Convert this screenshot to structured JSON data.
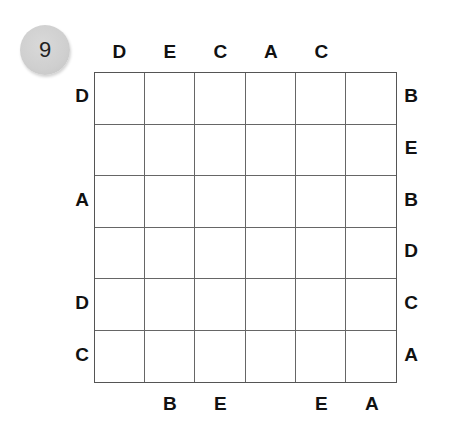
{
  "puzzle": {
    "number": "9",
    "rows": 6,
    "cols": 6,
    "clues": {
      "top": [
        "D",
        "E",
        "C",
        "A",
        "C",
        ""
      ],
      "bottom": [
        "",
        "B",
        "E",
        "",
        "E",
        "A"
      ],
      "left": [
        "D",
        "",
        "A",
        "",
        "D",
        "C"
      ],
      "right": [
        "B",
        "E",
        "B",
        "D",
        "C",
        "A"
      ]
    },
    "cells": [
      [
        "",
        "",
        "",
        "",
        "",
        ""
      ],
      [
        "",
        "",
        "",
        "",
        "",
        ""
      ],
      [
        "",
        "",
        "",
        "",
        "",
        ""
      ],
      [
        "",
        "",
        "",
        "",
        "",
        ""
      ],
      [
        "",
        "",
        "",
        "",
        "",
        ""
      ],
      [
        "",
        "",
        "",
        "",
        "",
        ""
      ]
    ]
  }
}
